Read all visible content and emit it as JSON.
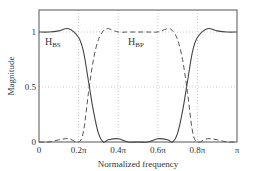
{
  "chart_data": {
    "type": "line",
    "title": "",
    "xlabel": "Normalized frequency",
    "ylabel": "Magnitude",
    "xlim": [
      0,
      1
    ],
    "ylim": [
      0,
      1.2
    ],
    "grid": true,
    "x_ticks": [
      "0",
      "0.2π",
      "0.4π",
      "0.6π",
      "0.8π",
      "π"
    ],
    "y_ticks": [
      "0",
      "0.5",
      "1"
    ],
    "x": [
      0,
      0.05,
      0.1,
      0.15,
      0.2,
      0.225,
      0.25,
      0.275,
      0.3,
      0.325,
      0.35,
      0.4,
      0.45,
      0.5,
      0.55,
      0.6,
      0.65,
      0.675,
      0.7,
      0.725,
      0.75,
      0.775,
      0.8,
      0.85,
      0.9,
      0.95,
      1.0
    ],
    "series": [
      {
        "name": "H_BS",
        "style": "solid",
        "values": [
          1.0,
          1.0,
          1.01,
          1.03,
          0.95,
          0.82,
          0.55,
          0.28,
          0.08,
          0.0,
          0.02,
          0.03,
          0.0,
          0.0,
          0.0,
          0.03,
          0.02,
          0.0,
          0.08,
          0.28,
          0.55,
          0.82,
          0.95,
          1.03,
          1.01,
          1.0,
          1.0
        ]
      },
      {
        "name": "H_BP",
        "style": "dashed",
        "values": [
          0.0,
          0.0,
          0.02,
          0.03,
          0.0,
          0.1,
          0.45,
          0.75,
          0.93,
          1.01,
          1.03,
          1.0,
          1.0,
          1.0,
          1.0,
          1.0,
          1.03,
          1.01,
          0.93,
          0.75,
          0.45,
          0.1,
          0.0,
          0.03,
          0.02,
          0.0,
          0.0
        ]
      }
    ],
    "annotations": [
      {
        "text": "H",
        "sub": "BS",
        "x": 0.03,
        "y": 0.88
      },
      {
        "text": "H",
        "sub": "BP",
        "x": 0.45,
        "y": 0.88
      }
    ]
  }
}
